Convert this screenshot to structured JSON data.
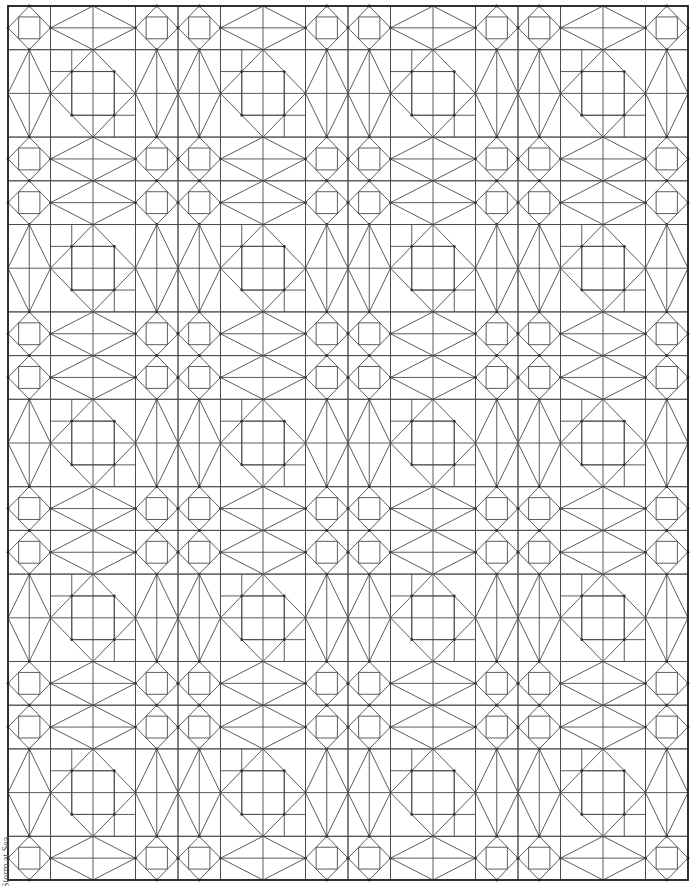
{
  "pattern": {
    "title": "Storm at Sea",
    "line_color": "#4a4a4a",
    "border_color": "#222222",
    "background": "#ffffff",
    "bounds": {
      "x0": 8,
      "y0": 6,
      "x1": 688,
      "y1": 880
    },
    "columns": [
      "S",
      "R",
      "SS",
      "R",
      "SS",
      "R",
      "SS",
      "R",
      "S"
    ],
    "rows": [
      "S",
      "R",
      "SS",
      "R",
      "SS",
      "R",
      "SS",
      "R",
      "SS",
      "R",
      "S"
    ],
    "units_wide": 16,
    "units_tall": 20,
    "blocks": {
      "small_square": "square with diamond through edge midpoints and inner axis-aligned square",
      "large_square": "square with diamond through edge midpoints and quarter-grid lines",
      "rectangle": "rectangle with diamond through edge midpoints and center cross lines"
    }
  }
}
